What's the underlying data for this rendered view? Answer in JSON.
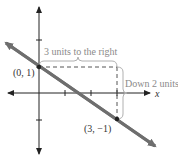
{
  "diagram": {
    "type": "coordinate-plane-slope",
    "axes": {
      "x_label": "x",
      "y_label": "y"
    },
    "points": [
      {
        "label": "(0, 1)",
        "x": 0,
        "y": 1
      },
      {
        "label": "(3, −1)",
        "x": 3,
        "y": -1
      }
    ],
    "annotations": {
      "horizontal": "3 units to the right",
      "vertical": "Down 2 units"
    },
    "colors": {
      "line": "#6e6e6e",
      "axes": "#222222",
      "dashed": "#555555",
      "annotation_text": "#8a8a8a",
      "brace": "#b0b0b0"
    }
  }
}
